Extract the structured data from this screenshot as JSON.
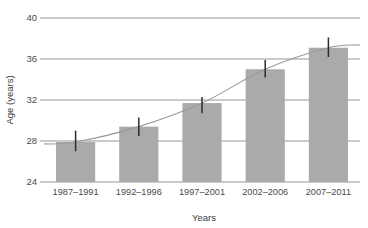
{
  "chart_data": {
    "type": "bar",
    "title": "",
    "xlabel": "Years",
    "ylabel": "Age (years)",
    "categories": [
      "1987–1991",
      "1992–1996",
      "1997–2001",
      "2002–2006",
      "2007–2011"
    ],
    "values": [
      27.9,
      29.4,
      31.7,
      35.0,
      37.1
    ],
    "error_low": [
      27.0,
      28.5,
      30.7,
      34.2,
      36.2
    ],
    "error_high": [
      29.0,
      30.3,
      32.3,
      35.9,
      38.1
    ],
    "ylim": [
      24,
      40
    ],
    "yticks": [
      24,
      28,
      32,
      36,
      40
    ],
    "ytick_labels": [
      "24",
      "28",
      "32",
      "36",
      "40"
    ],
    "grid": true,
    "legend": "none",
    "series": [
      {
        "name": "Mean age",
        "values": [
          27.9,
          29.4,
          31.7,
          35.0,
          37.1
        ]
      },
      {
        "name": "Trend",
        "type": "line",
        "values": [
          27.9,
          29.4,
          31.7,
          35.0,
          37.1
        ]
      }
    ],
    "colors": {
      "bar": "#abaaaa",
      "error_bar": "#2b2b2b",
      "trend_line": "#9a9a9a",
      "gridline": "#8a8a8a",
      "text": "#4a4a4a"
    }
  }
}
